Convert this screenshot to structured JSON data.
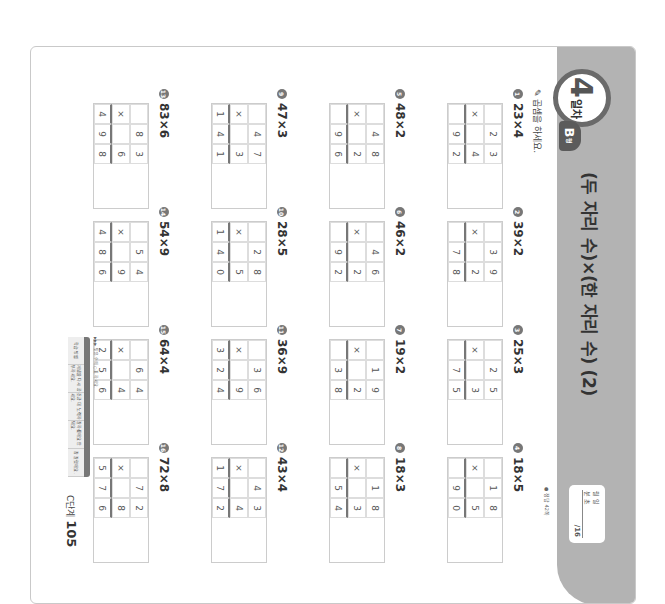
{
  "header": {
    "day_number": "4",
    "day_suffix": "일차",
    "type_letter": "B",
    "type_suffix": "형",
    "title": "(두 자리 수)×(한 자리 수) (2)",
    "score_box": {
      "date_label": "월  일",
      "time_label": "분  초",
      "total": "/16"
    },
    "answer_note": "● 정답 42쪽"
  },
  "instruction": "곱셈을 하세요.",
  "problems": [
    {
      "num": "1",
      "label": "23×4",
      "cells": [
        [
          "",
          "2",
          "3"
        ],
        [
          "×",
          "",
          "4"
        ],
        [
          "",
          "9",
          "2"
        ]
      ]
    },
    {
      "num": "2",
      "label": "39×2",
      "cells": [
        [
          "",
          "3",
          "9"
        ],
        [
          "×",
          "",
          "2"
        ],
        [
          "",
          "7",
          "8"
        ]
      ]
    },
    {
      "num": "3",
      "label": "25×3",
      "cells": [
        [
          "",
          "2",
          "5"
        ],
        [
          "×",
          "",
          "3"
        ],
        [
          "",
          "7",
          "5"
        ]
      ]
    },
    {
      "num": "4",
      "label": "18×5",
      "cells": [
        [
          "",
          "1",
          "8"
        ],
        [
          "×",
          "",
          "5"
        ],
        [
          "",
          "9",
          "0"
        ]
      ]
    },
    {
      "num": "5",
      "label": "48×2",
      "cells": [
        [
          "",
          "4",
          "8"
        ],
        [
          "×",
          "",
          "2"
        ],
        [
          "",
          "9",
          "6"
        ]
      ]
    },
    {
      "num": "6",
      "label": "46×2",
      "cells": [
        [
          "",
          "4",
          "6"
        ],
        [
          "×",
          "",
          "2"
        ],
        [
          "",
          "9",
          "2"
        ]
      ]
    },
    {
      "num": "7",
      "label": "19×2",
      "cells": [
        [
          "",
          "1",
          "9"
        ],
        [
          "×",
          "",
          "2"
        ],
        [
          "",
          "3",
          "8"
        ]
      ]
    },
    {
      "num": "8",
      "label": "18×3",
      "cells": [
        [
          "",
          "1",
          "8"
        ],
        [
          "×",
          "",
          "3"
        ],
        [
          "",
          "5",
          "4"
        ]
      ]
    },
    {
      "num": "9",
      "label": "47×3",
      "cells": [
        [
          "",
          "4",
          "7"
        ],
        [
          "×",
          "",
          "3"
        ],
        [
          "1",
          "4",
          "1"
        ]
      ]
    },
    {
      "num": "10",
      "label": "28×5",
      "cells": [
        [
          "",
          "2",
          "8"
        ],
        [
          "×",
          "",
          "5"
        ],
        [
          "1",
          "4",
          "0"
        ]
      ]
    },
    {
      "num": "11",
      "label": "36×9",
      "cells": [
        [
          "",
          "3",
          "6"
        ],
        [
          "×",
          "",
          "9"
        ],
        [
          "3",
          "2",
          "4"
        ]
      ]
    },
    {
      "num": "12",
      "label": "43×4",
      "cells": [
        [
          "",
          "4",
          "3"
        ],
        [
          "×",
          "",
          "4"
        ],
        [
          "1",
          "7",
          "2"
        ]
      ]
    },
    {
      "num": "13",
      "label": "83×6",
      "cells": [
        [
          "",
          "8",
          "3"
        ],
        [
          "×",
          "",
          "6"
        ],
        [
          "4",
          "9",
          "8"
        ]
      ]
    },
    {
      "num": "14",
      "label": "54×9",
      "cells": [
        [
          "",
          "5",
          "4"
        ],
        [
          "×",
          "",
          "9"
        ],
        [
          "4",
          "8",
          "6"
        ]
      ]
    },
    {
      "num": "15",
      "label": "64×4",
      "cells": [
        [
          "",
          "6",
          "4"
        ],
        [
          "×",
          "",
          "4"
        ],
        [
          "2",
          "5",
          "6"
        ]
      ]
    },
    {
      "num": "16",
      "label": "72×8",
      "cells": [
        [
          "",
          "7",
          "2"
        ],
        [
          "×",
          "",
          "8"
        ],
        [
          "5",
          "7",
          "6"
        ]
      ]
    }
  ],
  "footer": {
    "note": "▶▶▶ 맞은 수에 ○표 하세요.",
    "table_cells": [
      "학습 방법",
      "개념을 다시 공부하세요.",
      "조금 더 노력하세요.",
      "잘하셨어요 안 돼요.",
      "참 잘했어요."
    ],
    "page_label": "C단계",
    "page_number": "105"
  }
}
